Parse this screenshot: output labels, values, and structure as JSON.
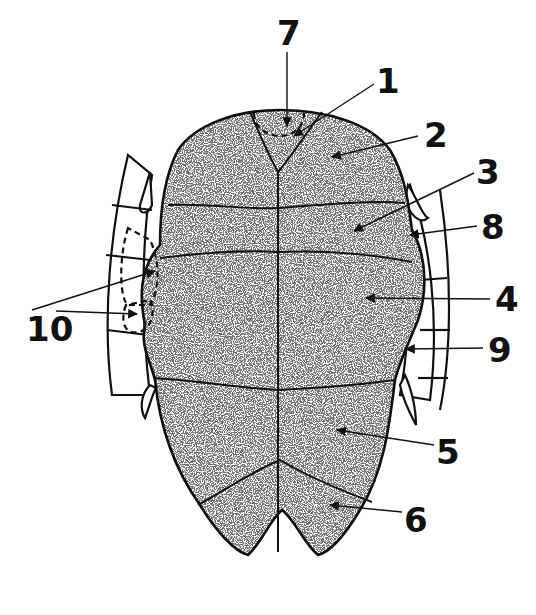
{
  "figure": {
    "stroke_color": "#111111",
    "fill_color": "#ffffff",
    "stipple_color": "#333333"
  },
  "labels": [
    {
      "id": "1",
      "text": "1"
    },
    {
      "id": "2",
      "text": "2"
    },
    {
      "id": "3",
      "text": "3"
    },
    {
      "id": "4",
      "text": "4"
    },
    {
      "id": "5",
      "text": "5"
    },
    {
      "id": "6",
      "text": "6"
    },
    {
      "id": "7",
      "text": "7"
    },
    {
      "id": "8",
      "text": "8"
    },
    {
      "id": "9",
      "text": "9"
    },
    {
      "id": "10",
      "text": "10"
    }
  ]
}
